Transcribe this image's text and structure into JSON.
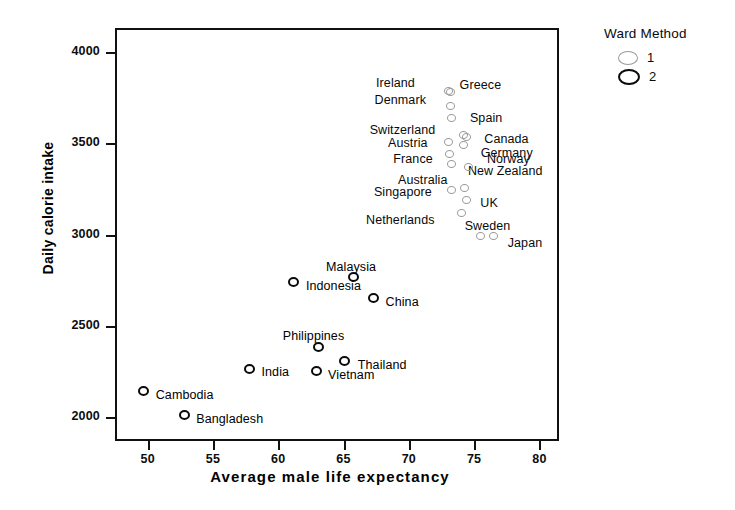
{
  "chart_data": {
    "type": "scatter",
    "title": "",
    "xlabel": "Average male life expectancy",
    "ylabel": "Daily calorie intake",
    "xlim": [
      47.5,
      81.5
    ],
    "ylim": [
      1870,
      4130
    ],
    "xticks": [
      50,
      55,
      60,
      65,
      70,
      75,
      80
    ],
    "yticks": [
      2000,
      2500,
      3000,
      3500,
      4000
    ],
    "grid": false,
    "legend": {
      "title": "Ward Method",
      "position": "top-right",
      "entries": [
        {
          "label": "1",
          "color": "#9a9a9a",
          "marker": "open-circle-thin"
        },
        {
          "label": "2",
          "color": "#0a0a0a",
          "marker": "open-circle-bold"
        }
      ]
    },
    "series": [
      {
        "name": "1",
        "color": "#9a9a9a",
        "points": [
          {
            "label": "Ireland",
            "x": 73.0,
            "y": 3785,
            "lx": -72,
            "ly": -14
          },
          {
            "label": "Greece",
            "x": 73.2,
            "y": 3780,
            "lx": 9,
            "ly": -13
          },
          {
            "label": "Denmark",
            "x": 73.2,
            "y": 3705,
            "lx": -76,
            "ly": -12
          },
          {
            "label": "Spain",
            "x": 73.3,
            "y": 3640,
            "lx": 18,
            "ly": -6
          },
          {
            "label": "Switzerland",
            "x": 74.2,
            "y": 3545,
            "lx": -94,
            "ly": -11
          },
          {
            "label": "Canada",
            "x": 74.4,
            "y": 3535,
            "lx": 18,
            "ly": -4
          },
          {
            "label": "Austria",
            "x": 73.0,
            "y": 3505,
            "lx": -60,
            "ly": -5
          },
          {
            "label": "Germany",
            "x": 74.2,
            "y": 3490,
            "lx": 17,
            "ly": 2
          },
          {
            "label": "France",
            "x": 73.1,
            "y": 3440,
            "lx": -56,
            "ly": -1
          },
          {
            "label": "New Zealand",
            "x": 73.3,
            "y": 3385,
            "lx": 16,
            "ly": 1
          },
          {
            "label": "Norway",
            "x": 74.6,
            "y": 3370,
            "lx": 18,
            "ly": -14
          },
          {
            "label": "Australia",
            "x": 74.3,
            "y": 3255,
            "lx": -67,
            "ly": -14
          },
          {
            "label": "Singapore",
            "x": 73.3,
            "y": 3245,
            "lx": -78,
            "ly": -4
          },
          {
            "label": "UK",
            "x": 74.4,
            "y": 3190,
            "lx": 14,
            "ly": -3
          },
          {
            "label": "Netherlands",
            "x": 74.0,
            "y": 3120,
            "lx": -95,
            "ly": 1
          },
          {
            "label": "Sweden",
            "x": 75.5,
            "y": 2990,
            "lx": -16,
            "ly": -16
          },
          {
            "label": "Japan",
            "x": 76.5,
            "y": 2990,
            "lx": 14,
            "ly": 1
          }
        ]
      },
      {
        "name": "2",
        "color": "#0a0a0a",
        "points": [
          {
            "label": "Malaysia",
            "x": 65.8,
            "y": 2765,
            "lx": -28,
            "ly": -16
          },
          {
            "label": "Indonesia",
            "x": 61.2,
            "y": 2740,
            "lx": 12,
            "ly": -2
          },
          {
            "label": "China",
            "x": 67.3,
            "y": 2655,
            "lx": 12,
            "ly": -2
          },
          {
            "label": "Philippines",
            "x": 63.1,
            "y": 2385,
            "lx": -36,
            "ly": -17
          },
          {
            "label": "Thailand",
            "x": 65.1,
            "y": 2310,
            "lx": 13,
            "ly": -2
          },
          {
            "label": "Vietnam",
            "x": 62.9,
            "y": 2255,
            "lx": 12,
            "ly": -2
          },
          {
            "label": "India",
            "x": 57.8,
            "y": 2265,
            "lx": 12,
            "ly": -3
          },
          {
            "label": "Cambodia",
            "x": 49.7,
            "y": 2145,
            "lx": 12,
            "ly": -2
          },
          {
            "label": "Bangladesh",
            "x": 52.8,
            "y": 2010,
            "lx": 12,
            "ly": -2
          }
        ]
      }
    ]
  }
}
